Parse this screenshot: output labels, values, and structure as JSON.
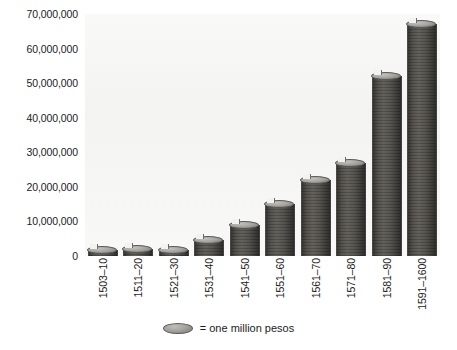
{
  "chart_data": {
    "type": "bar",
    "title": "",
    "subtitle": "",
    "xlabel": "",
    "ylabel": "",
    "ylim": [
      0,
      70000000
    ],
    "grid": false,
    "legend_position": "bottom",
    "unit_note": "Each coin glyph represents one million pesos",
    "categories": [
      "1503–10",
      "1511–20",
      "1521–30",
      "1531–40",
      "1541–50",
      "1551–60",
      "1561–70",
      "1571–80",
      "1581–90",
      "1591–1600"
    ],
    "values": [
      1500000,
      2000000,
      1000000,
      4500000,
      9000000,
      15000000,
      22000000,
      27000000,
      52000000,
      67000000
    ],
    "ytick_labels": [
      "70,000,000",
      "60,000,000",
      "50,000,000",
      "40,000,000",
      "30,000,000",
      "20,000,000",
      "10,000,000",
      "0"
    ],
    "ytick_values": [
      70000000,
      60000000,
      50000000,
      40000000,
      30000000,
      20000000,
      10000000,
      0
    ],
    "legend": [
      {
        "marker": "coin-icon",
        "label": "= one million pesos"
      }
    ],
    "colors": {
      "plot_background": "#f2f2f0",
      "page_background": "#ffffff",
      "coin_light": "#c0beba",
      "coin_mid": "#8e8c88",
      "coin_dark": "#4f4d4b",
      "text": "#1c1c1c"
    }
  }
}
